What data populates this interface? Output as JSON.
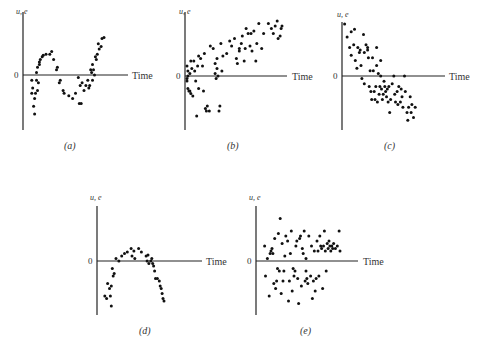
{
  "chart_data": [
    {
      "type": "scatter",
      "panel": "(a)",
      "ylabel": "u, e",
      "xlabel": "Time",
      "zero_label": "0",
      "pattern": "cyclical",
      "xlim": [
        0,
        100
      ],
      "ylim": [
        -1,
        1
      ],
      "points": [
        [
          5,
          -0.1
        ],
        [
          5,
          -0.35
        ],
        [
          6,
          -0.25
        ],
        [
          7,
          -0.6
        ],
        [
          8,
          -0.45
        ],
        [
          8,
          -0.75
        ],
        [
          9,
          -0.35
        ],
        [
          10,
          0.05
        ],
        [
          10,
          -0.1
        ],
        [
          11,
          0.15
        ],
        [
          11,
          -0.3
        ],
        [
          12,
          -0.15
        ],
        [
          13,
          0.2
        ],
        [
          13,
          0.25
        ],
        [
          14,
          0.3
        ],
        [
          16,
          0.35
        ],
        [
          17,
          0.38
        ],
        [
          20,
          0.4
        ],
        [
          24,
          0.4
        ],
        [
          26,
          0.45
        ],
        [
          28,
          0.3
        ],
        [
          31,
          0.1
        ],
        [
          32,
          0.15
        ],
        [
          34,
          -0.15
        ],
        [
          35,
          -0.1
        ],
        [
          38,
          -0.3
        ],
        [
          39,
          -0.35
        ],
        [
          44,
          -0.4
        ],
        [
          48,
          -0.45
        ],
        [
          51,
          -0.35
        ],
        [
          54,
          -0.05
        ],
        [
          55,
          -0.55
        ],
        [
          56,
          -0.2
        ],
        [
          57,
          -0.55
        ],
        [
          58,
          -0.15
        ],
        [
          60,
          -0.3
        ],
        [
          62,
          -0.2
        ],
        [
          64,
          -0.1
        ],
        [
          65,
          -0.25
        ],
        [
          66,
          -0.2
        ],
        [
          67,
          0.1
        ],
        [
          68,
          0.05
        ],
        [
          69,
          0.2
        ],
        [
          69,
          -0.1
        ],
        [
          70,
          0.1
        ],
        [
          71,
          0.0
        ],
        [
          72,
          0.35
        ],
        [
          73,
          0.3
        ],
        [
          74,
          0.4
        ],
        [
          75,
          0.6
        ],
        [
          76,
          0.5
        ],
        [
          78,
          0.55
        ],
        [
          79,
          0.7
        ],
        [
          81,
          0.72
        ]
      ]
    },
    {
      "type": "scatter",
      "panel": "(b)",
      "ylabel": "u, e",
      "xlabel": "Time",
      "zero_label": "0",
      "pattern": "upward trend",
      "xlim": [
        0,
        100
      ],
      "ylim": [
        -1,
        1
      ],
      "points": [
        [
          1,
          0.2
        ],
        [
          1,
          -0.1
        ],
        [
          1,
          -0.05
        ],
        [
          2,
          0.1
        ],
        [
          2,
          0.0
        ],
        [
          2,
          -0.25
        ],
        [
          3,
          -0.3
        ],
        [
          4,
          0.05
        ],
        [
          4,
          -0.3
        ],
        [
          5,
          0.3
        ],
        [
          5,
          -0.35
        ],
        [
          6,
          0.15
        ],
        [
          7,
          -0.4
        ],
        [
          8,
          0.3
        ],
        [
          9,
          0.1
        ],
        [
          10,
          -0.1
        ],
        [
          11,
          -0.8
        ],
        [
          12,
          0.2
        ],
        [
          13,
          0.4
        ],
        [
          13,
          -0.25
        ],
        [
          15,
          0.35
        ],
        [
          17,
          0.2
        ],
        [
          18,
          -0.3
        ],
        [
          19,
          0.45
        ],
        [
          20,
          -0.65
        ],
        [
          21,
          -0.7
        ],
        [
          22,
          -0.6
        ],
        [
          24,
          -0.7
        ],
        [
          25,
          0.6
        ],
        [
          28,
          0.55
        ],
        [
          30,
          0.05
        ],
        [
          30,
          0.25
        ],
        [
          31,
          -0.05
        ],
        [
          32,
          0.35
        ],
        [
          32,
          0.15
        ],
        [
          33,
          0.0
        ],
        [
          34,
          -0.7
        ],
        [
          35,
          -0.6
        ],
        [
          36,
          0.65
        ],
        [
          37,
          0.1
        ],
        [
          38,
          0.4
        ],
        [
          42,
          0.45
        ],
        [
          45,
          0.7
        ],
        [
          47,
          0.6
        ],
        [
          50,
          0.75
        ],
        [
          52,
          0.35
        ],
        [
          53,
          0.25
        ],
        [
          55,
          0.55
        ],
        [
          55,
          0.5
        ],
        [
          57,
          0.65
        ],
        [
          58,
          0.8
        ],
        [
          60,
          0.3
        ],
        [
          61,
          0.55
        ],
        [
          62,
          0.95
        ],
        [
          64,
          0.85
        ],
        [
          66,
          0.6
        ],
        [
          67,
          0.85
        ],
        [
          68,
          0.5
        ],
        [
          70,
          0.9
        ],
        [
          72,
          0.3
        ],
        [
          73,
          0.65
        ],
        [
          75,
          1.05
        ],
        [
          78,
          0.55
        ],
        [
          80,
          0.85
        ],
        [
          85,
          1.05
        ],
        [
          88,
          0.95
        ],
        [
          90,
          0.85
        ],
        [
          92,
          1.0
        ],
        [
          94,
          1.1
        ],
        [
          95,
          0.75
        ],
        [
          97,
          0.8
        ],
        [
          98,
          0.95
        ],
        [
          99,
          1.0
        ]
      ]
    },
    {
      "type": "scatter",
      "panel": "(c)",
      "ylabel": "u, e",
      "xlabel": "Time",
      "zero_label": "0",
      "pattern": "downward trend",
      "xlim": [
        0,
        100
      ],
      "ylim": [
        -1,
        1
      ],
      "points": [
        [
          2,
          1.0
        ],
        [
          5,
          0.75
        ],
        [
          8,
          0.55
        ],
        [
          10,
          0.85
        ],
        [
          10,
          0.4
        ],
        [
          13,
          0.6
        ],
        [
          14,
          0.9
        ],
        [
          15,
          0.3
        ],
        [
          17,
          0.15
        ],
        [
          18,
          0.55
        ],
        [
          20,
          0.45
        ],
        [
          21,
          0.5
        ],
        [
          22,
          0.2
        ],
        [
          23,
          -0.05
        ],
        [
          25,
          0.8
        ],
        [
          26,
          0.45
        ],
        [
          26,
          -0.15
        ],
        [
          28,
          0.6
        ],
        [
          30,
          0.55
        ],
        [
          30,
          0.5
        ],
        [
          31,
          0.35
        ],
        [
          32,
          -0.2
        ],
        [
          33,
          0.1
        ],
        [
          34,
          -0.3
        ],
        [
          35,
          -0.45
        ],
        [
          36,
          0.35
        ],
        [
          37,
          0.1
        ],
        [
          38,
          -0.3
        ],
        [
          39,
          -0.45
        ],
        [
          40,
          -0.2
        ],
        [
          41,
          0.55
        ],
        [
          41,
          0.2
        ],
        [
          42,
          -0.5
        ],
        [
          43,
          0.05
        ],
        [
          44,
          -0.35
        ],
        [
          45,
          -0.2
        ],
        [
          46,
          0.0
        ],
        [
          46,
          0.3
        ],
        [
          47,
          -0.25
        ],
        [
          48,
          -0.45
        ],
        [
          49,
          -0.35
        ],
        [
          50,
          -0.1
        ],
        [
          51,
          -0.2
        ],
        [
          52,
          -0.3
        ],
        [
          53,
          -0.4
        ],
        [
          54,
          -0.25
        ],
        [
          55,
          -0.5
        ],
        [
          56,
          -0.2
        ],
        [
          57,
          -0.7
        ],
        [
          58,
          -0.45
        ],
        [
          60,
          -0.15
        ],
        [
          62,
          0.0
        ],
        [
          63,
          -0.35
        ],
        [
          64,
          -0.5
        ],
        [
          66,
          -0.3
        ],
        [
          67,
          -0.55
        ],
        [
          68,
          -0.2
        ],
        [
          70,
          -0.5
        ],
        [
          71,
          -0.25
        ],
        [
          72,
          -0.4
        ],
        [
          73,
          -0.6
        ],
        [
          75,
          0.0
        ],
        [
          76,
          -0.3
        ],
        [
          78,
          -0.7
        ],
        [
          79,
          -0.85
        ],
        [
          80,
          -0.6
        ],
        [
          82,
          -0.4
        ],
        [
          83,
          -0.7
        ],
        [
          84,
          -0.55
        ],
        [
          86,
          -0.8
        ],
        [
          88,
          -0.6
        ]
      ]
    },
    {
      "type": "scatter",
      "panel": "(d)",
      "ylabel": "u, e",
      "xlabel": "Time",
      "zero_label": "0",
      "pattern": "inverted U (quadratic)",
      "xlim": [
        0,
        100
      ],
      "ylim": [
        -1,
        1
      ],
      "points": [
        [
          4,
          -0.7
        ],
        [
          6,
          -0.75
        ],
        [
          7,
          -0.45
        ],
        [
          9,
          -0.55
        ],
        [
          10,
          -0.7
        ],
        [
          11,
          -0.5
        ],
        [
          11,
          -0.9
        ],
        [
          12,
          -0.15
        ],
        [
          13,
          -0.3
        ],
        [
          14,
          -0.25
        ],
        [
          16,
          0.05
        ],
        [
          19,
          0.0
        ],
        [
          22,
          0.1
        ],
        [
          25,
          0.15
        ],
        [
          28,
          0.18
        ],
        [
          32,
          0.25
        ],
        [
          33,
          0.1
        ],
        [
          35,
          0.2
        ],
        [
          36,
          0.05
        ],
        [
          40,
          0.25
        ],
        [
          43,
          0.18
        ],
        [
          48,
          0.1
        ],
        [
          49,
          0.0
        ],
        [
          50,
          0.12
        ],
        [
          51,
          -0.05
        ],
        [
          53,
          0.0
        ],
        [
          54,
          0.05
        ],
        [
          55,
          -0.05
        ],
        [
          56,
          -0.1
        ],
        [
          57,
          -0.2
        ],
        [
          58,
          -0.35
        ],
        [
          60,
          -0.35
        ],
        [
          62,
          -0.4
        ],
        [
          63,
          -0.5
        ],
        [
          64,
          -0.55
        ],
        [
          65,
          -0.65
        ],
        [
          66,
          -0.75
        ],
        [
          67,
          -0.8
        ]
      ]
    },
    {
      "type": "scatter",
      "panel": "(e)",
      "ylabel": "u, e",
      "xlabel": "Time",
      "zero_label": "0",
      "pattern": "random (no pattern)",
      "xlim": [
        0,
        100
      ],
      "ylim": [
        -1,
        1
      ],
      "points": [
        [
          5,
          0.3
        ],
        [
          6,
          -0.3
        ],
        [
          8,
          0.05
        ],
        [
          10,
          -0.7
        ],
        [
          11,
          0.15
        ],
        [
          12,
          0.2
        ],
        [
          13,
          0.25
        ],
        [
          14,
          0.15
        ],
        [
          15,
          -0.45
        ],
        [
          16,
          0.45
        ],
        [
          17,
          -0.55
        ],
        [
          18,
          -0.4
        ],
        [
          19,
          -0.15
        ],
        [
          20,
          0.55
        ],
        [
          21,
          -0.2
        ],
        [
          22,
          0.85
        ],
        [
          23,
          -0.65
        ],
        [
          24,
          0.35
        ],
        [
          25,
          -0.4
        ],
        [
          26,
          -0.2
        ],
        [
          27,
          0.1
        ],
        [
          28,
          0.5
        ],
        [
          30,
          0.4
        ],
        [
          31,
          -0.8
        ],
        [
          32,
          -0.4
        ],
        [
          33,
          0.15
        ],
        [
          34,
          0.6
        ],
        [
          35,
          -0.6
        ],
        [
          36,
          -0.15
        ],
        [
          37,
          -0.3
        ],
        [
          38,
          -0.2
        ],
        [
          39,
          0.3
        ],
        [
          40,
          0.4
        ],
        [
          41,
          -0.35
        ],
        [
          42,
          -0.85
        ],
        [
          43,
          0.45
        ],
        [
          44,
          0.5
        ],
        [
          45,
          -0.5
        ],
        [
          46,
          0.25
        ],
        [
          47,
          0.15
        ],
        [
          48,
          0.6
        ],
        [
          49,
          -0.4
        ],
        [
          50,
          0.05
        ],
        [
          50,
          -0.2
        ],
        [
          51,
          -0.35
        ],
        [
          52,
          -0.45
        ],
        [
          53,
          0.5
        ],
        [
          55,
          -0.3
        ],
        [
          56,
          0.3
        ],
        [
          57,
          -0.75
        ],
        [
          58,
          -0.4
        ],
        [
          59,
          0.2
        ],
        [
          60,
          -0.6
        ],
        [
          61,
          -0.35
        ],
        [
          62,
          0.4
        ],
        [
          63,
          0.2
        ],
        [
          64,
          -0.3
        ],
        [
          65,
          0.5
        ],
        [
          66,
          0.3
        ],
        [
          67,
          0.25
        ],
        [
          68,
          -0.55
        ],
        [
          69,
          0.3
        ],
        [
          70,
          0.6
        ],
        [
          71,
          0.2
        ],
        [
          72,
          -0.2
        ],
        [
          73,
          0.35
        ],
        [
          74,
          0.25
        ],
        [
          75,
          0.4
        ],
        [
          76,
          0.3
        ],
        [
          77,
          0.2
        ],
        [
          78,
          0.3
        ],
        [
          79,
          0.25
        ],
        [
          80,
          0.35
        ],
        [
          82,
          0.25
        ],
        [
          84,
          0.3
        ],
        [
          86,
          0.6
        ],
        [
          87,
          0.2
        ]
      ]
    }
  ]
}
